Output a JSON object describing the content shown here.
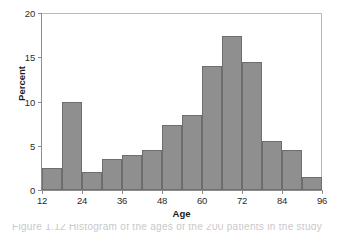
{
  "chart_data": {
    "type": "bar",
    "title": "",
    "xlabel": "Age",
    "ylabel": "Percent",
    "xlim": [
      12,
      96
    ],
    "ylim": [
      0,
      20
    ],
    "ytick_labels": [
      "0",
      "5",
      "10",
      "15",
      "20"
    ],
    "ytick_values": [
      0,
      5,
      10,
      15,
      20
    ],
    "xtick_labels": [
      "12",
      "24",
      "36",
      "48",
      "60",
      "72",
      "84",
      "96"
    ],
    "xtick_values": [
      12,
      24,
      36,
      48,
      60,
      72,
      84,
      96
    ],
    "grid": false,
    "legend": null,
    "bin_width": 6,
    "bin_edges": [
      12,
      18,
      24,
      30,
      36,
      42,
      48,
      54,
      60,
      66,
      72,
      78,
      84,
      90,
      96
    ],
    "categories": [
      "12-18",
      "18-24",
      "24-30",
      "30-36",
      "36-42",
      "42-48",
      "48-54",
      "54-60",
      "60-66",
      "66-72",
      "72-78",
      "78-84",
      "84-90",
      "90-96"
    ],
    "values": [
      2.5,
      10.0,
      2.0,
      3.5,
      4.0,
      4.5,
      7.4,
      8.5,
      14.0,
      17.4,
      14.5,
      5.5,
      4.5,
      1.5
    ],
    "bar_fill_color": "#8f8f8f",
    "bar_border_color": "#6e6e6e",
    "frame_color": "#8d8d8d",
    "text_color": "#2b2b2b"
  },
  "caption_sliver": "Figure 1.12   Histogram of the ages of the 200 patients in the study"
}
